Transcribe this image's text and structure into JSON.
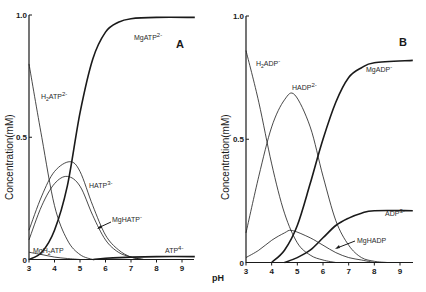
{
  "figure": {
    "x_axis_label": "pH",
    "colors": {
      "ink": "#1a1a1a",
      "background": "#ffffff"
    }
  },
  "chart_data": [
    {
      "type": "line",
      "panel_label": "A",
      "title": "",
      "xlabel": "pH",
      "ylabel": "Concentration(mM)",
      "xlim": [
        3,
        9.5
      ],
      "ylim": [
        0,
        1.0
      ],
      "x_ticks": [
        "3",
        "4",
        "5",
        "6",
        "7",
        "8",
        "9"
      ],
      "y_ticks": [
        "0",
        "0.5",
        "1.0"
      ],
      "grid": false,
      "legend": "inline labels",
      "series": [
        {
          "name": "MgATP2-",
          "label_main": "MgATP",
          "label_sup": "2-",
          "weight": "thick",
          "x": [
            3,
            3.5,
            4,
            4.5,
            5,
            5.5,
            6,
            6.5,
            7,
            8,
            9.5
          ],
          "y": [
            0,
            0.03,
            0.12,
            0.3,
            0.6,
            0.82,
            0.93,
            0.97,
            0.985,
            0.99,
            0.99
          ]
        },
        {
          "name": "H2ATP2-",
          "label_main": "H2ATP",
          "label_sup": "2-",
          "weight": "thin",
          "x": [
            3,
            3.5,
            4,
            4.5,
            5,
            5.5
          ],
          "y": [
            0.8,
            0.5,
            0.22,
            0.08,
            0.02,
            0
          ]
        },
        {
          "name": "HATP3-",
          "label_main": "HATP",
          "label_sup": "3-",
          "weight": "thin",
          "x": [
            3,
            3.5,
            4,
            4.6,
            5,
            5.5,
            6,
            6.5,
            7,
            7.5
          ],
          "y": [
            0.12,
            0.26,
            0.36,
            0.4,
            0.36,
            0.22,
            0.1,
            0.04,
            0.01,
            0
          ]
        },
        {
          "name": "MgHATP-",
          "label_main": "MgHATP",
          "label_sup": "-",
          "weight": "thin",
          "x": [
            3,
            3.5,
            4,
            4.5,
            5,
            5.5,
            6,
            6.5,
            7,
            7.5
          ],
          "y": [
            0.08,
            0.22,
            0.31,
            0.34,
            0.3,
            0.18,
            0.08,
            0.03,
            0.01,
            0
          ]
        },
        {
          "name": "MgH2ATP",
          "label_main": "MgH2ATP",
          "label_sup": "",
          "weight": "thin",
          "x": [
            3,
            3.5,
            4,
            4.5,
            5
          ],
          "y": [
            0.03,
            0.02,
            0.01,
            0.004,
            0
          ]
        },
        {
          "name": "ATP4-",
          "label_main": "ATP",
          "label_sup": "4-",
          "weight": "thick",
          "x": [
            5.5,
            6,
            7,
            8,
            9.5
          ],
          "y": [
            0,
            0.005,
            0.01,
            0.012,
            0.012
          ]
        }
      ]
    },
    {
      "type": "line",
      "panel_label": "B",
      "title": "",
      "xlabel": "pH",
      "ylabel": "Concentration(mM)",
      "xlim": [
        3,
        9.5
      ],
      "ylim": [
        0,
        1.0
      ],
      "x_ticks": [
        "3",
        "4",
        "5",
        "6",
        "7",
        "8",
        "9"
      ],
      "y_ticks": [
        "0",
        "0.5",
        "1.0"
      ],
      "grid": false,
      "legend": "inline labels",
      "series": [
        {
          "name": "H2ADP-",
          "label_main": "H2ADP",
          "label_sup": "-",
          "weight": "thin",
          "x": [
            3,
            3.5,
            4,
            4.5,
            5,
            5.5,
            6,
            6.5
          ],
          "y": [
            0.86,
            0.65,
            0.4,
            0.2,
            0.08,
            0.03,
            0.01,
            0
          ]
        },
        {
          "name": "HADP2-",
          "label_main": "HADP",
          "label_sup": "2-",
          "weight": "thin",
          "x": [
            3,
            3.5,
            4,
            4.5,
            4.9,
            5.5,
            6,
            6.5,
            7,
            7.5,
            8,
            8.5
          ],
          "y": [
            0.12,
            0.35,
            0.55,
            0.66,
            0.68,
            0.55,
            0.35,
            0.17,
            0.07,
            0.02,
            0.005,
            0
          ]
        },
        {
          "name": "MgADP-",
          "label_main": "MgADP",
          "label_sup": "-",
          "weight": "thick",
          "x": [
            4,
            4.5,
            5,
            5.5,
            6,
            6.5,
            7,
            7.5,
            8,
            9.5
          ],
          "y": [
            0,
            0.05,
            0.15,
            0.32,
            0.5,
            0.65,
            0.75,
            0.79,
            0.81,
            0.82
          ]
        },
        {
          "name": "ADP3-",
          "label_main": "ADP",
          "label_sup": "3-",
          "weight": "thick",
          "x": [
            4.5,
            5,
            5.5,
            6,
            6.5,
            7,
            7.5,
            8,
            9.5
          ],
          "y": [
            0,
            0.02,
            0.05,
            0.1,
            0.15,
            0.18,
            0.2,
            0.21,
            0.21
          ]
        },
        {
          "name": "MgHADP",
          "label_main": "MgHADP",
          "label_sup": "",
          "weight": "thin",
          "x": [
            3,
            3.5,
            4,
            4.5,
            4.8,
            5.5,
            6,
            6.5,
            7,
            7.5,
            8
          ],
          "y": [
            0.02,
            0.05,
            0.09,
            0.12,
            0.13,
            0.1,
            0.07,
            0.04,
            0.02,
            0.01,
            0
          ]
        }
      ]
    }
  ]
}
